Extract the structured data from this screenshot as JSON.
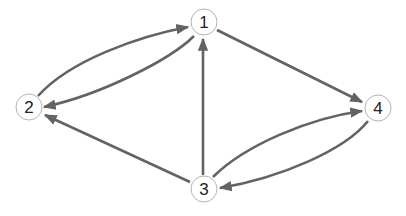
{
  "graph": {
    "type": "directed",
    "colors": {
      "edge": "#636363",
      "node_border": "#b5b5b5",
      "label": "#222222",
      "background": "#ffffff"
    },
    "nodes": [
      {
        "id": "1",
        "label": "1",
        "x": 204,
        "y": 22
      },
      {
        "id": "2",
        "label": "2",
        "x": 29,
        "y": 107
      },
      {
        "id": "3",
        "label": "3",
        "x": 204,
        "y": 189
      },
      {
        "id": "4",
        "label": "4",
        "x": 378,
        "y": 108
      }
    ],
    "edges": [
      {
        "from": "2",
        "to": "1",
        "curved": true
      },
      {
        "from": "1",
        "to": "2",
        "curved": true
      },
      {
        "from": "1",
        "to": "4",
        "curved": false
      },
      {
        "from": "3",
        "to": "1",
        "curved": false
      },
      {
        "from": "3",
        "to": "2",
        "curved": false
      },
      {
        "from": "3",
        "to": "4",
        "curved": true
      },
      {
        "from": "4",
        "to": "3",
        "curved": true
      }
    ]
  }
}
